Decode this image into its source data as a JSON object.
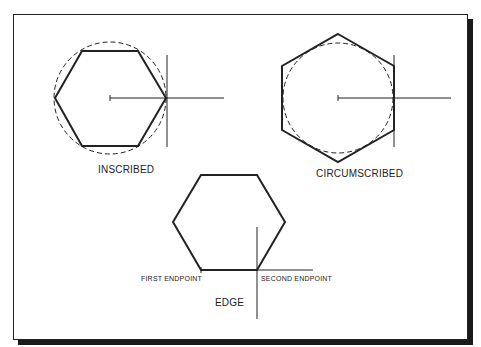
{
  "figure": {
    "labels": {
      "inscribed": "INSCRIBED",
      "circumscribed": "CIRCUMSCRIBED",
      "edge": "EDGE",
      "first_endpoint": "FIRST ENDPOINT",
      "second_endpoint": "SECOND ENDPOINT"
    },
    "colors": {
      "line": "#222222",
      "background": "#ffffff",
      "shadow": "#1a1a1a"
    }
  }
}
